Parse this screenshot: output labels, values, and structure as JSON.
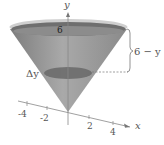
{
  "diagram": {
    "type": "cone-volume-slice",
    "axes": {
      "y_label": "y",
      "x_label": "x",
      "x_ticks": [
        "-4",
        "-2",
        "2",
        "4"
      ],
      "y_tick_top": "6"
    },
    "annotations": {
      "brace_label": "6 − y",
      "slice_label": "Δy"
    },
    "colors": {
      "cone_fill": "#8f8f8f",
      "cone_dark": "#6a6a6a",
      "top_rim": "#c8c8c8",
      "slice": "#6e6e6e",
      "axis": "#777777",
      "text": "#555555"
    }
  }
}
